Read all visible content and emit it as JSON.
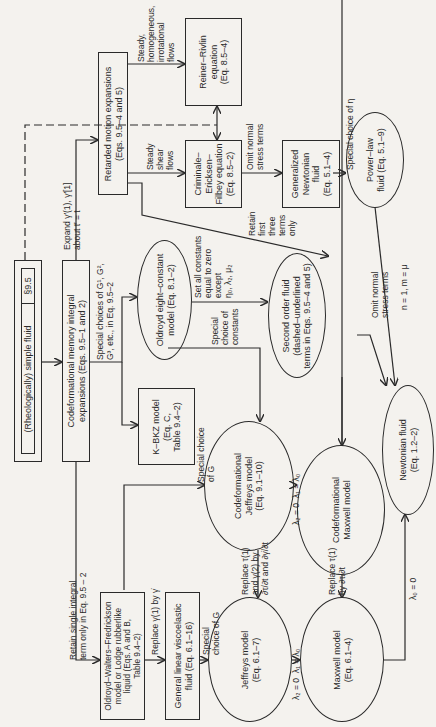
{
  "nodes": {
    "simple_fluid": {
      "label": "(Rheologically) simple fluid",
      "section": "§9.5"
    },
    "codeformational_memory": {
      "label": "Codeformational memory integral\nexpansions (Eqs. 9.5–1 and 2)"
    },
    "retarded_motion": {
      "label": "Retarded motion expansions\n(Eqs. 9.5–4 and 5)"
    },
    "reiner_rivlin": {
      "label": "Reiner–Rivlin\nequation\n(Eq. 8.5–4)"
    },
    "cef": {
      "label": "Criminale–\nEricksen–\nFilbey equation\n(Eq. 8.5–2)"
    },
    "generalized_newtonian": {
      "label": "Generalized\nNewtonian\nfluid\n(Eq. 5.1–4)"
    },
    "power_law": {
      "label": "Power–law\nfluid (Eq. 5.1–9)"
    },
    "oldroyd_eight": {
      "label": "Oldroyd eight–constant\nmodel (Eq. 8.1–2)"
    },
    "kbkz": {
      "label": "K–BKZ model\n(Eq. C,\nTable 9.4–2)"
    },
    "second_order": {
      "label": "Second order fluid\n(dashed–underlined\nterms in Eqs. 9.5–4 and 5)"
    },
    "newtonian": {
      "label": "Newtonian fluid\n(Eq. 1.2–2)"
    },
    "codef_jeffreys": {
      "label": "Codeformational\nJeffreys model\n(Eq. 9.1–10)"
    },
    "codef_maxwell": {
      "label": "Codeformational\nMaxwell model"
    },
    "owf_lodge": {
      "label": "Oldroyd–Walters–Fredrickson\nmodel or Lodge rubberlike\nliquid (Eqs. A and B,\nTable 9.4–2)"
    },
    "general_linear": {
      "label": "General linear viscoelastic\nfluid (Eq. 6.1–16)"
    },
    "jeffreys": {
      "label": "Jeffreys model\n(Eq. 6.1–7)"
    },
    "maxwell": {
      "label": "Maxwell model\n(Eq. 6.1–4)"
    }
  },
  "edges": {
    "expand": "Expand γ′(1), γ′[1]\nabout t′ = t",
    "steady_homog": "Steady,\nhomogeneous,\nirrotational\nflows",
    "steady_shear": "Steady\nshear\nflows",
    "omit_normal_1": "Omit normal\nstress terms",
    "special_eta": "Special choice of η",
    "retain_three": "Retain\nfirst\nthree\nterms\nonly",
    "special_G_choices": "Special choices of G¹, G²,\nG³, etc., in Eq. 9.5–2",
    "set_constants": "Set all constants\nequal to zero\nexcept\nη₀, λ₂, μ₂",
    "special_constants": "Special\nchoice of\nconstants",
    "omit_normal_2": "Omit normal\nstress terms",
    "n_m": "n = 1, m = μ",
    "special_G_1": "Special choice\nof G",
    "special_G_2": "Special\nchoice of G",
    "retain_single": "Retain single integral\nterm only in Eq. 9.5 – 2",
    "replace_gamma": "Replace γ(1) by γ̇",
    "lambda_jeffreys_codef": "λ₂ = 0  λ₁ = λ₀",
    "lambda_jeffreys": "λ₂ = 0  λ₁ = λ₀",
    "replace_tau_1": "Replace τ(1)\nand γ(2) by\n∂τ/∂t and ∂γ̇/∂t",
    "replace_tau_2": "Replace τ(1)\nby ∂τ/∂t",
    "lambda0": "λ₀ = 0"
  }
}
